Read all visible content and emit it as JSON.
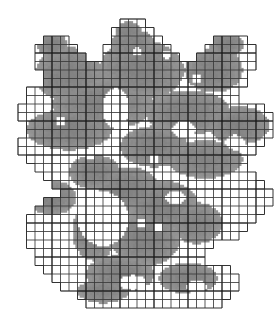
{
  "figure": {
    "kind": "box-counting-grid-over-fractal",
    "title": "",
    "caption": "",
    "background_color": "#ffffff",
    "shape_fill_color": "#8e8e8e",
    "shape_fill_color_light": "#a8a8a8",
    "grid_line_color": "#3a3a3a",
    "grid_line_color_major": "#1a1a1a",
    "grid": {
      "cell_size_px": 8.5,
      "origin_x_px": 18,
      "origin_y_px": 19,
      "columns": 30,
      "rows": 34,
      "major_every": 4,
      "minor_line_width_px": 0.6,
      "major_line_width_px": 1.2,
      "only_occupied_cells_outlined": true
    },
    "counts": {
      "occupied_cells": 612,
      "total_cells": 1020
    },
    "shape_mask_runs": [
      [
        [
          12,
          14
        ]
      ],
      [
        [
          11,
          15
        ]
      ],
      [
        [
          3,
          5
        ],
        [
          11,
          16
        ],
        [
          23,
          26
        ]
      ],
      [
        [
          2,
          6
        ],
        [
          10,
          17
        ],
        [
          22,
          27
        ]
      ],
      [
        [
          2,
          7
        ],
        [
          10,
          18
        ],
        [
          21,
          27
        ]
      ],
      [
        [
          2,
          8
        ],
        [
          9,
          19
        ],
        [
          20,
          27
        ]
      ],
      [
        [
          3,
          9
        ],
        [
          9,
          20
        ],
        [
          20,
          26
        ]
      ],
      [
        [
          3,
          20
        ],
        [
          21,
          26
        ]
      ],
      [
        [
          1,
          20
        ],
        [
          21,
          25
        ]
      ],
      [
        [
          1,
          21
        ],
        [
          22,
          25
        ]
      ],
      [
        [
          0,
          12
        ],
        [
          13,
          22
        ],
        [
          23,
          28
        ]
      ],
      [
        [
          0,
          12
        ],
        [
          13,
          24
        ],
        [
          25,
          29
        ]
      ],
      [
        [
          1,
          11
        ],
        [
          13,
          29
        ]
      ],
      [
        [
          1,
          11
        ],
        [
          12,
          29
        ]
      ],
      [
        [
          0,
          11
        ],
        [
          12,
          28
        ]
      ],
      [
        [
          0,
          12
        ],
        [
          13,
          27
        ]
      ],
      [
        [
          1,
          13
        ],
        [
          14,
          26
        ]
      ],
      [
        [
          2,
          14
        ],
        [
          15,
          26
        ]
      ],
      [
        [
          3,
          15
        ],
        [
          16,
          27
        ]
      ],
      [
        [
          4,
          16
        ],
        [
          17,
          28
        ]
      ],
      [
        [
          5,
          17
        ],
        [
          18,
          29
        ]
      ],
      [
        [
          3,
          7
        ],
        [
          6,
          18
        ],
        [
          19,
          29
        ]
      ],
      [
        [
          2,
          8
        ],
        [
          6,
          19
        ],
        [
          20,
          28
        ]
      ],
      [
        [
          1,
          9
        ],
        [
          6,
          20
        ],
        [
          21,
          27
        ]
      ],
      [
        [
          1,
          9
        ],
        [
          6,
          21
        ],
        [
          22,
          26
        ]
      ],
      [
        [
          1,
          9
        ],
        [
          6,
          22
        ],
        [
          23,
          25
        ]
      ],
      [
        [
          1,
          9
        ],
        [
          6,
          22
        ]
      ],
      [
        [
          2,
          9
        ],
        [
          6,
          21
        ]
      ],
      [
        [
          2,
          10
        ],
        [
          7,
          21
        ]
      ],
      [
        [
          3,
          11
        ],
        [
          8,
          22
        ],
        [
          17,
          24
        ]
      ],
      [
        [
          4,
          13
        ],
        [
          9,
          23
        ],
        [
          17,
          25
        ]
      ],
      [
        [
          5,
          14
        ],
        [
          10,
          23
        ],
        [
          17,
          25
        ]
      ],
      [
        [
          7,
          13
        ],
        [
          11,
          22
        ],
        [
          18,
          24
        ]
      ],
      [
        [
          8,
          12
        ],
        [
          12,
          21
        ],
        [
          18,
          23
        ]
      ]
    ],
    "blob_seeds": [
      {
        "cx": 13.0,
        "cy": 1.5,
        "rx": 1.6,
        "ry": 1.2
      },
      {
        "cx": 13.5,
        "cy": 3.0,
        "rx": 2.6,
        "ry": 1.8
      },
      {
        "cx": 4.0,
        "cy": 3.0,
        "rx": 1.8,
        "ry": 1.4
      },
      {
        "cx": 24.5,
        "cy": 3.0,
        "rx": 2.0,
        "ry": 1.5
      },
      {
        "cx": 6.0,
        "cy": 6.5,
        "rx": 4.0,
        "ry": 3.2
      },
      {
        "cx": 14.5,
        "cy": 6.0,
        "rx": 5.0,
        "ry": 3.5
      },
      {
        "cx": 23.0,
        "cy": 6.0,
        "rx": 3.4,
        "ry": 2.6
      },
      {
        "cx": 10.0,
        "cy": 10.0,
        "rx": 6.0,
        "ry": 3.0
      },
      {
        "cx": 20.0,
        "cy": 11.0,
        "rx": 5.0,
        "ry": 2.6
      },
      {
        "cx": 26.0,
        "cy": 12.5,
        "rx": 3.6,
        "ry": 2.2
      },
      {
        "cx": 6.0,
        "cy": 13.0,
        "rx": 5.0,
        "ry": 2.4
      },
      {
        "cx": 16.0,
        "cy": 15.0,
        "rx": 4.0,
        "ry": 2.4
      },
      {
        "cx": 22.0,
        "cy": 16.5,
        "rx": 4.4,
        "ry": 2.2
      },
      {
        "cx": 9.0,
        "cy": 18.0,
        "rx": 3.0,
        "ry": 2.0
      },
      {
        "cx": 13.0,
        "cy": 20.0,
        "rx": 3.6,
        "ry": 2.6
      },
      {
        "cx": 4.0,
        "cy": 21.0,
        "rx": 2.8,
        "ry": 2.0
      },
      {
        "cx": 17.0,
        "cy": 22.0,
        "rx": 4.2,
        "ry": 3.0
      },
      {
        "cx": 9.0,
        "cy": 25.0,
        "rx": 2.6,
        "ry": 3.4
      },
      {
        "cx": 15.0,
        "cy": 26.0,
        "rx": 4.0,
        "ry": 3.0
      },
      {
        "cx": 21.0,
        "cy": 24.0,
        "rx": 3.0,
        "ry": 2.4
      },
      {
        "cx": 12.0,
        "cy": 30.0,
        "rx": 4.0,
        "ry": 2.2
      },
      {
        "cx": 20.0,
        "cy": 30.5,
        "rx": 3.4,
        "ry": 1.8
      },
      {
        "cx": 10.0,
        "cy": 32.0,
        "rx": 3.0,
        "ry": 1.4
      }
    ],
    "holes": [
      {
        "cx": 14.0,
        "cy": 3.8,
        "rx": 0.5,
        "ry": 0.5
      },
      {
        "cx": 17.5,
        "cy": 4.2,
        "rx": 0.5,
        "ry": 0.5
      },
      {
        "cx": 21.0,
        "cy": 7.0,
        "rx": 0.6,
        "ry": 0.5
      },
      {
        "cx": 11.5,
        "cy": 10.5,
        "rx": 1.6,
        "ry": 2.4
      },
      {
        "cx": 5.0,
        "cy": 12.0,
        "rx": 0.6,
        "ry": 0.5
      },
      {
        "cx": 19.5,
        "cy": 13.0,
        "rx": 1.4,
        "ry": 1.0
      },
      {
        "cx": 25.5,
        "cy": 14.5,
        "rx": 1.2,
        "ry": 0.9
      },
      {
        "cx": 8.5,
        "cy": 16.0,
        "rx": 0.6,
        "ry": 0.5
      },
      {
        "cx": 16.0,
        "cy": 16.5,
        "rx": 0.6,
        "ry": 0.5
      },
      {
        "cx": 10.0,
        "cy": 23.5,
        "rx": 3.0,
        "ry": 3.2
      },
      {
        "cx": 18.5,
        "cy": 21.0,
        "rx": 1.2,
        "ry": 0.8
      },
      {
        "cx": 14.5,
        "cy": 24.0,
        "rx": 0.6,
        "ry": 0.5
      },
      {
        "cx": 16.5,
        "cy": 24.5,
        "rx": 0.6,
        "ry": 0.5
      },
      {
        "cx": 13.5,
        "cy": 31.0,
        "rx": 1.6,
        "ry": 0.9
      },
      {
        "cx": 21.0,
        "cy": 31.5,
        "rx": 1.2,
        "ry": 0.8
      }
    ]
  }
}
